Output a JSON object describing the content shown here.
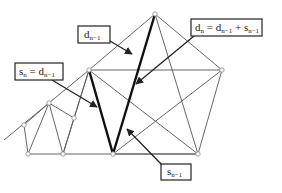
{
  "diagram": {
    "colors": {
      "background": "#ffffff",
      "thin_line": "#555555",
      "thick_line": "#111111",
      "node_fill": "#ffffff",
      "node_stroke": "#888888",
      "box_stroke": "#222222"
    },
    "nodes": [
      {
        "id": "apex",
        "x": 155,
        "y": 14
      },
      {
        "id": "big_ul",
        "x": 89,
        "y": 70
      },
      {
        "id": "big_ur",
        "x": 222,
        "y": 70
      },
      {
        "id": "big_bl",
        "x": 113,
        "y": 154
      },
      {
        "id": "big_br",
        "x": 198,
        "y": 154
      },
      {
        "id": "small_top",
        "x": 49,
        "y": 103
      },
      {
        "id": "small_left",
        "x": 24,
        "y": 125
      },
      {
        "id": "small_right",
        "x": 74,
        "y": 118
      },
      {
        "id": "small_bl",
        "x": 28,
        "y": 154
      },
      {
        "id": "small_bm",
        "x": 63,
        "y": 154
      }
    ],
    "labels": [
      {
        "id": "d_prev",
        "main": "d",
        "sub": "n−1",
        "box": {
          "x": 78,
          "y": 26,
          "w": 32,
          "h": 17
        }
      },
      {
        "id": "s_n_eq",
        "parts": [
          {
            "main": "s",
            "sub": "n"
          },
          {
            "main": " = d",
            "sub": "n−1"
          }
        ],
        "box": {
          "x": 15,
          "y": 63,
          "w": 48,
          "h": 17
        }
      },
      {
        "id": "d_n_eq",
        "parts": [
          {
            "main": "d",
            "sub": "n"
          },
          {
            "main": " = d",
            "sub": "n−1"
          },
          {
            "main": " + s",
            "sub": "n−1"
          }
        ],
        "box": {
          "x": 191,
          "y": 19,
          "w": 71,
          "h": 17
        }
      },
      {
        "id": "s_prev",
        "main": "s",
        "sub": "n−1",
        "box": {
          "x": 161,
          "y": 164,
          "w": 30,
          "h": 16
        }
      }
    ]
  }
}
